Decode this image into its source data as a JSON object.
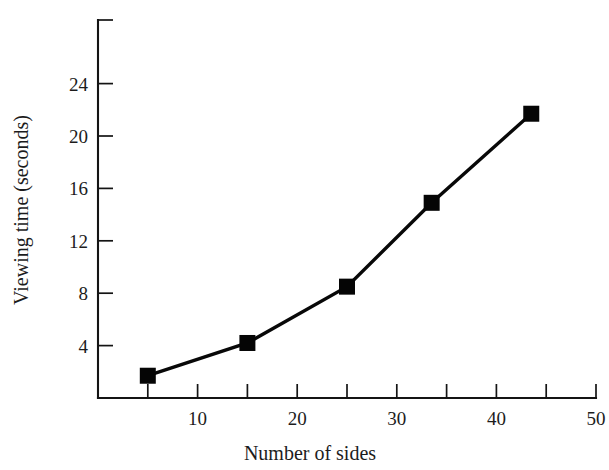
{
  "chart_data": {
    "type": "line",
    "title": "",
    "xlabel": "Number of sides",
    "ylabel": "Viewing time (seconds)",
    "xlim": [
      0,
      50
    ],
    "ylim": [
      0,
      26.5
    ],
    "grid": false,
    "legend": null,
    "x_ticks_major": [
      10,
      20,
      30,
      40,
      50
    ],
    "x_ticks_minor": [
      5,
      15,
      25,
      35,
      45
    ],
    "x_tick_labels": [
      "10",
      "20",
      "30",
      "40",
      "50"
    ],
    "y_ticks": [
      4,
      8,
      12,
      16,
      20,
      24
    ],
    "y_tick_labels": [
      "4",
      "8",
      "12",
      "16",
      "20",
      "24"
    ],
    "marker": "square",
    "marker_color": "#050505",
    "line_color": "#080808",
    "series": [
      {
        "name": "Viewing time",
        "x": [
          5,
          15,
          25,
          33.5,
          43.5
        ],
        "values": [
          1.7,
          4.2,
          8.5,
          14.9,
          21.7
        ]
      }
    ]
  },
  "axis_titles": {
    "x": "Number of sides",
    "y": "Viewing time (seconds)"
  }
}
